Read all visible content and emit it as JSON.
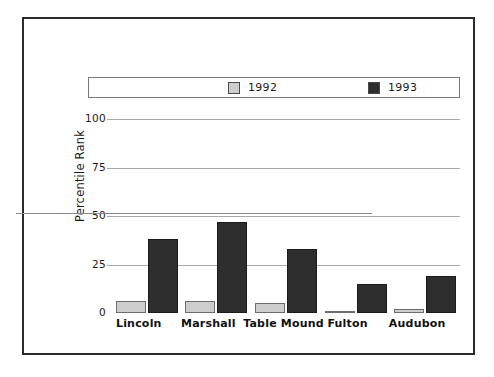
{
  "chart_data": {
    "type": "bar",
    "title": "",
    "xlabel": "",
    "ylabel": "Percentile Rank",
    "ylim": [
      0,
      100
    ],
    "yticks": [
      0,
      25,
      50,
      75,
      100
    ],
    "ytick_labels": [
      "0",
      "25",
      "50",
      "75",
      "100"
    ],
    "grid": true,
    "legend_position": "top",
    "categories": [
      "Lincoln",
      "Marshall",
      "Table Mound",
      "Fulton",
      "Audubon"
    ],
    "series": [
      {
        "name": "1992",
        "color": "#cdcdcd",
        "values": [
          6,
          6,
          5,
          1,
          2
        ]
      },
      {
        "name": "1993",
        "color": "#2e2e2e",
        "values": [
          38,
          47,
          33,
          15,
          19
        ]
      }
    ]
  },
  "legend": {
    "entries": [
      {
        "label": "1992",
        "color": "#cdcdcd"
      },
      {
        "label": "1993",
        "color": "#2e2e2e"
      }
    ]
  },
  "colors": {
    "series_1992": "#cdcdcd",
    "series_1993": "#2e2e2e",
    "gridline": "#a9a9a9",
    "frame": "#2b2b2b",
    "text": "#1a1a1a",
    "background": "#ffffff"
  }
}
